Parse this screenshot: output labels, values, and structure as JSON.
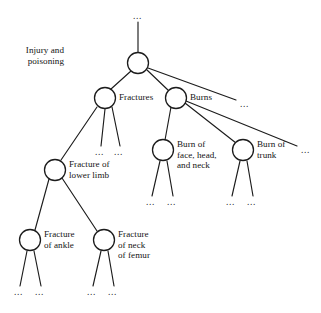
{
  "diagram": {
    "type": "tree",
    "canvas": {
      "width": 321,
      "height": 313
    },
    "style": {
      "background": "#ffffff",
      "stroke": "#1c1c1c",
      "node_fill": "#ffffff",
      "text_color": "#131313",
      "node_radius": 10.5
    },
    "nodes": [
      {
        "id": "root",
        "label": "Injury and\npoisoning",
        "cx": 138,
        "cy": 63,
        "r": 10.5,
        "label_x": 64,
        "label_y": 45,
        "label_align": "right"
      },
      {
        "id": "fractures",
        "label": "Fractures",
        "cx": 105,
        "cy": 98,
        "r": 10.5,
        "label_x": 119,
        "label_y": 92,
        "label_align": "left"
      },
      {
        "id": "burns",
        "label": "Burns",
        "cx": 176,
        "cy": 98,
        "r": 10.5,
        "label_x": 190,
        "label_y": 92,
        "label_align": "left"
      },
      {
        "id": "lower-limb",
        "label": "Fracture of\nlower limb",
        "cx": 55,
        "cy": 170,
        "r": 10.5,
        "label_x": 69,
        "label_y": 159,
        "label_align": "left"
      },
      {
        "id": "burn-face",
        "label": "Burn of\nface, head,\nand neck",
        "cx": 163,
        "cy": 150,
        "r": 10.5,
        "label_x": 177,
        "label_y": 139,
        "label_align": "left"
      },
      {
        "id": "burn-trunk",
        "label": "Burn of\ntrunk",
        "cx": 243,
        "cy": 150,
        "r": 10.5,
        "label_x": 257,
        "label_y": 139,
        "label_align": "left"
      },
      {
        "id": "ankle",
        "label": "Fracture\nof ankle",
        "cx": 30,
        "cy": 240,
        "r": 10.5,
        "label_x": 44,
        "label_y": 229,
        "label_align": "left"
      },
      {
        "id": "femur",
        "label": "Fracture\nof neck\nof femur",
        "cx": 104,
        "cy": 240,
        "r": 10.5,
        "label_x": 118,
        "label_y": 229,
        "label_align": "left"
      }
    ],
    "edges": [
      {
        "from": "above-root-ellipsis",
        "to": "root",
        "x1": 138,
        "y1": 22,
        "x2": 138,
        "y2": 52
      },
      {
        "from": "root",
        "to": "fractures",
        "x1": 131,
        "y1": 71,
        "x2": 111,
        "y2": 89
      },
      {
        "from": "root",
        "to": "burns",
        "x1": 147,
        "y1": 70,
        "x2": 169,
        "y2": 91
      },
      {
        "from": "root",
        "to": "root-ellipsis-right",
        "x1": 148,
        "y1": 68,
        "x2": 236,
        "y2": 100
      },
      {
        "from": "fractures",
        "to": "lower-limb",
        "x1": 97,
        "y1": 107,
        "x2": 61,
        "y2": 160
      },
      {
        "from": "fractures",
        "to": "frac-ellipsis-1",
        "x1": 105,
        "y1": 109,
        "x2": 101,
        "y2": 146
      },
      {
        "from": "fractures",
        "to": "frac-ellipsis-2",
        "x1": 112,
        "y1": 107,
        "x2": 120,
        "y2": 146
      },
      {
        "from": "burns",
        "to": "burn-face",
        "x1": 171,
        "y1": 107,
        "x2": 165,
        "y2": 140
      },
      {
        "from": "burns",
        "to": "burn-trunk",
        "x1": 185,
        "y1": 103,
        "x2": 236,
        "y2": 143
      },
      {
        "from": "burns",
        "to": "burns-ellipsis-right",
        "x1": 186,
        "y1": 101,
        "x2": 297,
        "y2": 146
      },
      {
        "from": "lower-limb",
        "to": "ankle",
        "x1": 49,
        "y1": 179,
        "x2": 35,
        "y2": 230
      },
      {
        "from": "lower-limb",
        "to": "femur",
        "x1": 62,
        "y1": 178,
        "x2": 97,
        "y2": 231
      },
      {
        "from": "burn-face",
        "to": "bf-ellipsis-1",
        "x1": 160,
        "y1": 161,
        "x2": 152,
        "y2": 196
      },
      {
        "from": "burn-face",
        "to": "bf-ellipsis-2",
        "x1": 167,
        "y1": 161,
        "x2": 173,
        "y2": 196
      },
      {
        "from": "burn-trunk",
        "to": "bt-ellipsis-1",
        "x1": 240,
        "y1": 161,
        "x2": 232,
        "y2": 196
      },
      {
        "from": "burn-trunk",
        "to": "bt-ellipsis-2",
        "x1": 247,
        "y1": 161,
        "x2": 253,
        "y2": 196
      },
      {
        "from": "ankle",
        "to": "ank-ellipsis-1",
        "x1": 27,
        "y1": 251,
        "x2": 20,
        "y2": 286
      },
      {
        "from": "ankle",
        "to": "ank-ellipsis-2",
        "x1": 34,
        "y1": 251,
        "x2": 41,
        "y2": 286
      },
      {
        "from": "femur",
        "to": "fem-ellipsis-1",
        "x1": 101,
        "y1": 251,
        "x2": 93,
        "y2": 286
      },
      {
        "from": "femur",
        "to": "fem-ellipsis-2",
        "x1": 108,
        "y1": 251,
        "x2": 114,
        "y2": 286
      }
    ],
    "ellipses": [
      {
        "id": "above-root-ellipsis",
        "text": "...",
        "x": 133,
        "y": 12
      },
      {
        "id": "root-ellipsis-right",
        "text": "...",
        "x": 240,
        "y": 100
      },
      {
        "id": "frac-ellipsis-1",
        "text": "...",
        "x": 95,
        "y": 148
      },
      {
        "id": "frac-ellipsis-2",
        "text": "...",
        "x": 114,
        "y": 148
      },
      {
        "id": "burns-ellipsis-right",
        "text": "...",
        "x": 301,
        "y": 146
      },
      {
        "id": "bf-ellipsis-1",
        "text": "...",
        "x": 146,
        "y": 198
      },
      {
        "id": "bf-ellipsis-2",
        "text": "...",
        "x": 167,
        "y": 198
      },
      {
        "id": "bt-ellipsis-1",
        "text": "...",
        "x": 226,
        "y": 198
      },
      {
        "id": "bt-ellipsis-2",
        "text": "...",
        "x": 247,
        "y": 198
      },
      {
        "id": "ank-ellipsis-1",
        "text": "...",
        "x": 14,
        "y": 288
      },
      {
        "id": "ank-ellipsis-2",
        "text": "...",
        "x": 35,
        "y": 288
      },
      {
        "id": "fem-ellipsis-1",
        "text": "...",
        "x": 87,
        "y": 288
      },
      {
        "id": "fem-ellipsis-2",
        "text": "...",
        "x": 108,
        "y": 288
      }
    ]
  }
}
